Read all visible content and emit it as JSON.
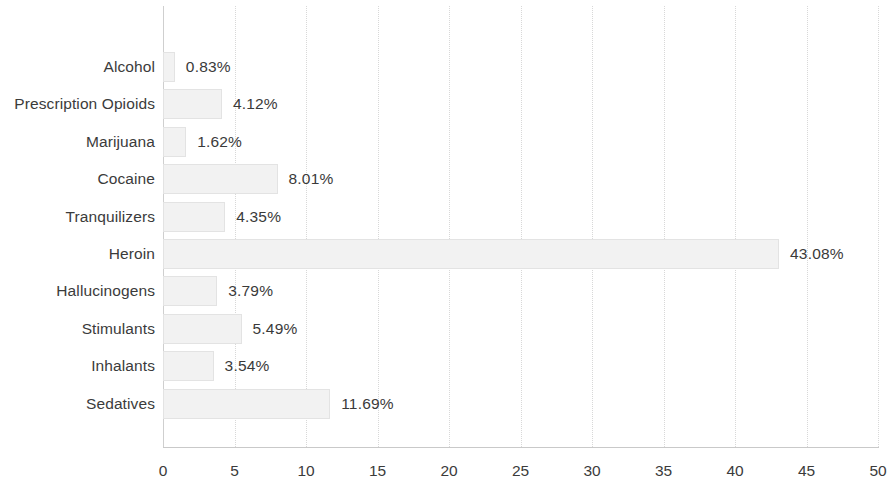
{
  "chart_data": {
    "type": "bar",
    "orientation": "horizontal",
    "title": "",
    "subtitle": "",
    "xlabel": "",
    "ylabel": "",
    "xlim": [
      0,
      50
    ],
    "xticks": [
      0,
      5,
      10,
      15,
      20,
      25,
      30,
      35,
      40,
      45,
      50
    ],
    "xtick_labels": [
      "0",
      "5",
      "10",
      "15",
      "20",
      "25",
      "30",
      "35",
      "40",
      "45",
      "50"
    ],
    "grid": "vertical-dotted",
    "legend": null,
    "categories": [
      "Alcohol",
      "Prescription Opioids",
      "Marijuana",
      "Cocaine",
      "Tranquilizers",
      "Heroin",
      "Hallucinogens",
      "Stimulants",
      "Inhalants",
      "Sedatives"
    ],
    "values": [
      0.83,
      4.12,
      1.62,
      8.01,
      4.35,
      43.08,
      3.79,
      5.49,
      3.54,
      11.69
    ],
    "value_labels": [
      "0.83%",
      "4.12%",
      "1.62%",
      "8.01%",
      "4.35%",
      "43.08%",
      "3.79%",
      "5.49%",
      "3.54%",
      "11.69%"
    ],
    "bars": [
      {
        "category": "Alcohol",
        "value": 0.83,
        "label": "0.83%"
      },
      {
        "category": "Prescription Opioids",
        "value": 4.12,
        "label": "4.12%"
      },
      {
        "category": "Marijuana",
        "value": 1.62,
        "label": "1.62%"
      },
      {
        "category": "Cocaine",
        "value": 8.01,
        "label": "8.01%"
      },
      {
        "category": "Tranquilizers",
        "value": 4.35,
        "label": "4.35%"
      },
      {
        "category": "Heroin",
        "value": 43.08,
        "label": "43.08%"
      },
      {
        "category": "Hallucinogens",
        "value": 3.79,
        "label": "3.79%"
      },
      {
        "category": "Stimulants",
        "value": 5.49,
        "label": "5.49%"
      },
      {
        "category": "Inhalants",
        "value": 3.54,
        "label": "3.54%"
      },
      {
        "category": "Sedatives",
        "value": 11.69,
        "label": "11.69%"
      }
    ],
    "colors": {
      "bar_fill": "#f2f2f2",
      "bar_border": "#e3e3e3",
      "grid": "#d8d8d8",
      "axis": "#c9c9c9",
      "text": "#3b3b3b",
      "background": "#ffffff"
    }
  }
}
